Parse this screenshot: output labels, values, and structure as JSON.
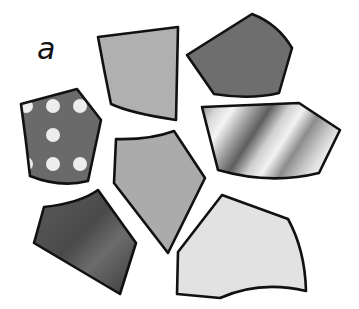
{
  "figure": {
    "label": "a",
    "label_pos": {
      "x": 37,
      "y": 36
    },
    "stroke_color": "#111111",
    "stroke_width": 2.6
  },
  "pieces": [
    {
      "id": "polka-dot-piece",
      "fill": "pattern-polka",
      "base_color": "#6a6a6a",
      "dot_color": "#ededed"
    },
    {
      "id": "top-gray-piece",
      "fill": "#b0b0b0"
    },
    {
      "id": "dark-pentagon-piece",
      "fill": "#6e6e6e"
    },
    {
      "id": "metallic-piece",
      "fill": "gradient-metal"
    },
    {
      "id": "middle-gray-piece",
      "fill": "#ababab"
    },
    {
      "id": "dark-gradient-piece",
      "fill": "gradient-dark"
    },
    {
      "id": "light-gray-piece",
      "fill": "#e2e2e2"
    }
  ]
}
